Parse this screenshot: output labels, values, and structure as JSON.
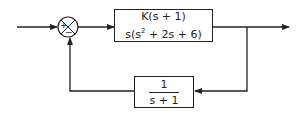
{
  "diagram": {
    "type": "feedback-control-block-diagram",
    "summing_junction": {
      "signs": {
        "left": "+",
        "bottom": "−"
      }
    },
    "forward_block": {
      "numerator": "K(s + 1)",
      "denominator_prefix": "s(s",
      "denominator_exp": "2",
      "denominator_suffix": " + 2s + 6)"
    },
    "feedback_block": {
      "numerator": "1",
      "denominator": "s + 1"
    },
    "colors": {
      "line": "#222222",
      "background": "#ffffff"
    }
  }
}
